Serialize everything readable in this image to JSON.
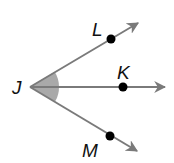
{
  "figure": {
    "type": "angle-diagram",
    "vertex": {
      "label": "J",
      "x": 30,
      "y": 87
    },
    "rays": [
      {
        "name": "JL",
        "point_label": "L",
        "point": {
          "x": 111,
          "y": 39
        },
        "tip": {
          "x": 138,
          "y": 23
        }
      },
      {
        "name": "JK",
        "point_label": "K",
        "point": {
          "x": 123,
          "y": 87
        },
        "tip": {
          "x": 165,
          "y": 87
        }
      },
      {
        "name": "JM",
        "point_label": "M",
        "point": {
          "x": 110,
          "y": 136
        },
        "tip": {
          "x": 137,
          "y": 151
        }
      }
    ],
    "shaded_angle": "LJM",
    "colors": {
      "ray": "#7a7a7a",
      "point": "#000000",
      "shade": "#9a9a9a",
      "label": "#111111"
    }
  },
  "labels": {
    "J": "J",
    "L": "L",
    "K": "K",
    "M": "M"
  }
}
